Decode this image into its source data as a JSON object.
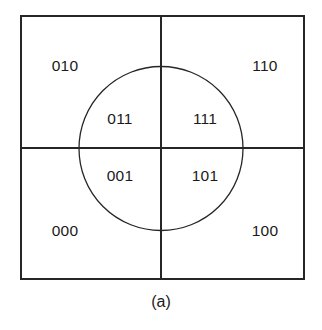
{
  "figure": {
    "caption": "(a)",
    "colors": {
      "stroke": "#262626",
      "text": "#1a1a1a",
      "background": "#ffffff"
    },
    "square": {
      "x": 21,
      "y": 16,
      "width": 283,
      "height": 263
    },
    "divider": {
      "center_x": 161,
      "center_y": 148
    },
    "circle": {
      "cx": 161,
      "cy": 148.5,
      "r": 82
    },
    "regions": [
      {
        "id": "outer-top-left",
        "label": "010",
        "x": 65,
        "y": 67
      },
      {
        "id": "outer-top-right",
        "label": "110",
        "x": 265,
        "y": 67
      },
      {
        "id": "inner-top-left",
        "label": "011",
        "x": 120,
        "y": 120
      },
      {
        "id": "inner-top-right",
        "label": "111",
        "x": 205,
        "y": 120
      },
      {
        "id": "inner-bottom-left",
        "label": "001",
        "x": 120,
        "y": 177
      },
      {
        "id": "inner-bottom-right",
        "label": "101",
        "x": 205,
        "y": 177
      },
      {
        "id": "outer-bottom-left",
        "label": "000",
        "x": 65,
        "y": 232
      },
      {
        "id": "outer-bottom-right",
        "label": "100",
        "x": 265,
        "y": 232
      }
    ]
  }
}
